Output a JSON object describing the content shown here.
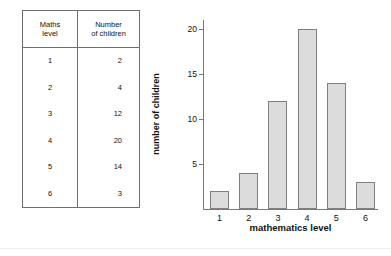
{
  "table": {
    "headers": [
      "Maths level",
      "Number of children"
    ],
    "header_lines": [
      [
        "Maths",
        "level"
      ],
      [
        "Number",
        "of children"
      ]
    ],
    "rows": [
      {
        "level": "1",
        "count": "2"
      },
      {
        "level": "2",
        "count": "4"
      },
      {
        "level": "3",
        "count": "12"
      },
      {
        "level": "4",
        "count": "20"
      },
      {
        "level": "5",
        "count": "14"
      },
      {
        "level": "6",
        "count": "3"
      }
    ]
  },
  "chart_data": {
    "type": "bar",
    "title": "",
    "categories": [
      "1",
      "2",
      "3",
      "4",
      "5",
      "6"
    ],
    "values": [
      2,
      4,
      12,
      20,
      14,
      3
    ],
    "xlabel": "mathematics level",
    "ylabel": "number of children",
    "ylim": [
      0,
      21
    ],
    "yticks": [
      5,
      10,
      15,
      20
    ],
    "ytick_labels": [
      "5",
      "10",
      "15",
      "20"
    ],
    "xtick_labels": [
      "1",
      "2",
      "3",
      "4",
      "5",
      "6"
    ],
    "grid": false,
    "legend": false,
    "bar_fill": "#dcdcdc",
    "bar_border": "#808080",
    "axis_color": "#7a7a7a"
  }
}
